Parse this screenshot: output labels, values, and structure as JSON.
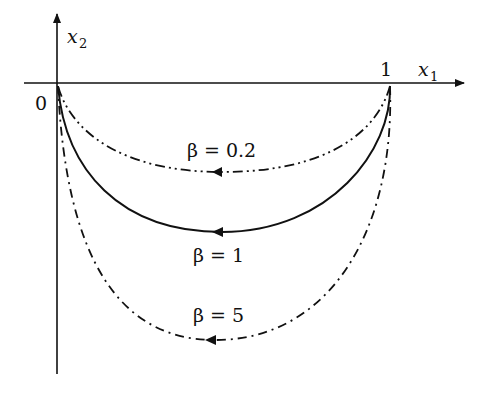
{
  "diagram": {
    "type": "trajectory-plot",
    "axes": {
      "x_label": "x",
      "x_label_sub": "1",
      "y_label": "x",
      "y_label_sub": "2",
      "origin_label": "0",
      "x_tick_label": "1"
    },
    "curves": [
      {
        "id": "beta-0.2",
        "label": "β = 0.2",
        "style": "dash-dot-dot",
        "direction": "right-to-left"
      },
      {
        "id": "beta-1",
        "label": "β = 1",
        "style": "solid",
        "direction": "right-to-left"
      },
      {
        "id": "beta-5",
        "label": "β = 5",
        "style": "dash-dot",
        "direction": "right-to-left"
      }
    ],
    "colors": {
      "stroke": "#111111",
      "background": "#ffffff"
    }
  }
}
